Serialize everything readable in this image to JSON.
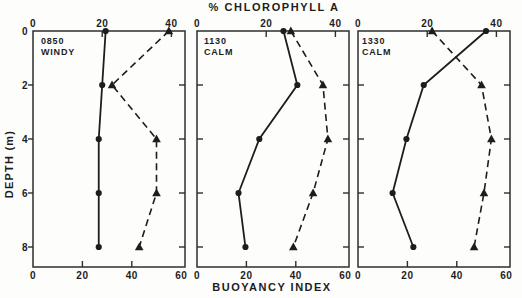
{
  "figure": {
    "title_top": "% CHLOROPHYLL A",
    "xlabel_bottom": "BUOYANCY INDEX",
    "ylabel_left": "DEPTH (m)"
  },
  "chart_data": {
    "type": "line",
    "title": "% CHLOROPHYLL A",
    "bottom_xlabel": "BUOYANCY INDEX",
    "ylabel": "DEPTH (m)",
    "depths_m": [
      0,
      2,
      4,
      6,
      8
    ],
    "top_axis": {
      "label": "% CHLOROPHYLL A",
      "ticks": [
        0,
        20,
        40
      ],
      "range": [
        0,
        44
      ]
    },
    "bottom_axis": {
      "label": "BUOYANCY INDEX",
      "ticks": [
        0,
        20,
        40,
        60
      ],
      "range": [
        0,
        61.5
      ]
    },
    "depth_axis": {
      "label": "DEPTH (m)",
      "ticks": [
        0,
        2,
        4,
        6,
        8
      ],
      "range": [
        0,
        8.75
      ]
    },
    "grid": "off",
    "ink_color": "#1d1d1d",
    "series_styles": {
      "chlorophyll": {
        "axis": "top",
        "marker": "circle",
        "line": "solid"
      },
      "buoyancy": {
        "axis": "bottom",
        "marker": "triangle",
        "line": "dashed"
      }
    },
    "panels": [
      {
        "time": "0850",
        "condition": "WINDY",
        "chlorophyll_pct": [
          21,
          20,
          19,
          19,
          19
        ],
        "buoyancy_index": [
          55,
          32,
          50,
          50,
          43
        ]
      },
      {
        "time": "1130",
        "condition": "CALM",
        "chlorophyll_pct": [
          25,
          29,
          18,
          12,
          14
        ],
        "buoyancy_index": [
          38,
          51,
          53,
          47,
          39
        ]
      },
      {
        "time": "1330",
        "condition": "CALM",
        "chlorophyll_pct": [
          37,
          19,
          14,
          10,
          16
        ],
        "buoyancy_index": [
          30,
          50,
          54,
          51,
          47
        ]
      }
    ]
  }
}
